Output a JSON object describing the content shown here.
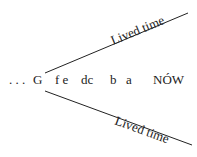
{
  "diagram": {
    "upper_label": "Lived time",
    "lower_label": "Lived time",
    "sequence": [
      {
        "id": "ellipsis",
        "text": ". . ."
      },
      {
        "id": "G",
        "text": "G"
      },
      {
        "id": "fe",
        "text": "f e"
      },
      {
        "id": "dc",
        "text": "dc"
      },
      {
        "id": "b",
        "text": "b"
      },
      {
        "id": "a",
        "text": "a"
      },
      {
        "id": "now",
        "text": "NÓW"
      }
    ]
  }
}
